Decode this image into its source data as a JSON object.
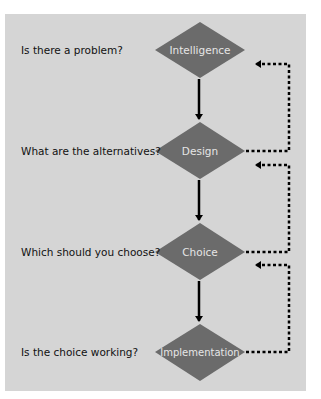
{
  "diagram": {
    "stages": [
      {
        "name": "Intelligence",
        "question": "Is there a problem?",
        "cy": 50
      },
      {
        "name": "Design",
        "question": "What are the alternatives?",
        "cy": 151
      },
      {
        "name": "Choice",
        "question": "Which should you choose?",
        "cy": 252
      },
      {
        "name": "Implementation",
        "question": "Is the choice working?",
        "cy": 352
      }
    ],
    "colors": {
      "background": "#d5d5d5",
      "node_fill": "#6b6b6b",
      "node_text": "#e6e6e6",
      "arrow": "#000000"
    },
    "flow": "Intelligence → Design → Choice → Implementation",
    "feedback": [
      "Design → Intelligence",
      "Choice → Design",
      "Implementation → Choice"
    ]
  }
}
